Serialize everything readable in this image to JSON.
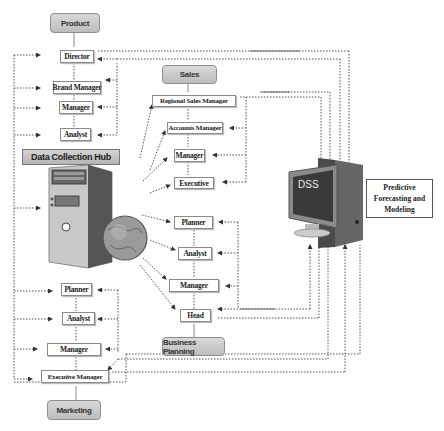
{
  "diagram": {
    "departments": {
      "product": "Product",
      "sales": "Sales",
      "business_planning": "Business Planning",
      "marketing": "Marketing"
    },
    "product_roles": [
      "Director",
      "Brand Manager",
      "Manager",
      "Analyst"
    ],
    "sales_roles": [
      "Regional Sales Manager",
      "Accounts Manager",
      "Manager",
      "Executive"
    ],
    "business_planning_roles": [
      "Planner",
      "Analyst",
      "Manager",
      "Head"
    ],
    "marketing_roles": [
      "Planner",
      "Analyst",
      "Manager",
      "Executive Manager"
    ],
    "hub": {
      "label": "Data Collection Hub",
      "icon": "server-globe-icon"
    },
    "dss": {
      "label": "DSS",
      "icon": "monitor-computer-icon",
      "module": "Predictive Forecasting and Modeling",
      "module_lines": [
        "Predictive",
        "Forecasting and",
        "Modeling"
      ]
    },
    "colors": {
      "dept_fill": "#c8c8c8",
      "line": "#555555",
      "box_border": "#8a8a8a"
    }
  }
}
